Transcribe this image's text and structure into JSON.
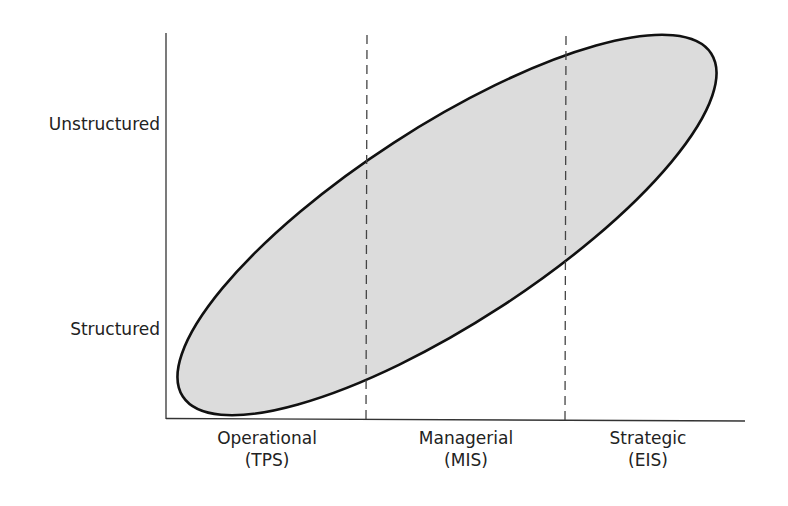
{
  "diagram": {
    "type": "ellipse-over-levels",
    "y_axis": {
      "labels": [
        {
          "text": "Unstructured",
          "y": 125
        },
        {
          "text": "Structured",
          "y": 330
        }
      ]
    },
    "x_axis": {
      "categories": [
        {
          "name": "Operational",
          "system": "(TPS)",
          "cx": 267
        },
        {
          "name": "Managerial",
          "system": "(MIS)",
          "cx": 466
        },
        {
          "name": "Strategic",
          "system": "(EIS)",
          "cx": 648
        }
      ]
    },
    "dividers": [
      367,
      566
    ],
    "ellipse": {
      "cx": 447,
      "cy": 225,
      "rx": 315,
      "ry": 98,
      "rotation_deg": -33,
      "fill": "#dcdcdc",
      "stroke": "#111111"
    },
    "colors": {
      "axis": "#333333",
      "divider": "#444444"
    }
  }
}
